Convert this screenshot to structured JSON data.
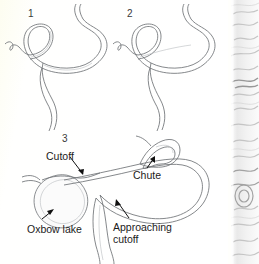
{
  "figure": {
    "kind": "river-meander-evolution-diagram",
    "background_color": "#fffffc",
    "ink_color": "#6f7276",
    "label_color": "#1b1b1b"
  },
  "panels": [
    {
      "id": "panel-1",
      "number": "1",
      "number_x": 28,
      "number_y": 8
    },
    {
      "id": "panel-2",
      "number": "2",
      "number_x": 127,
      "number_y": 8
    },
    {
      "id": "panel-3",
      "number": "3",
      "number_x": 62,
      "number_y": 133
    }
  ],
  "labels": [
    {
      "id": "label-cutoff",
      "text": "Cutoff",
      "x": 46,
      "y": 151
    },
    {
      "id": "label-chute",
      "text": "Chute",
      "x": 133,
      "y": 170
    },
    {
      "id": "label-oxbow-lake",
      "text": "Oxbow lake",
      "x": 27,
      "y": 224
    },
    {
      "id": "label-approaching-cutoff-1",
      "text": "Approaching",
      "x": 113,
      "y": 222
    },
    {
      "id": "label-approaching-cutoff-2",
      "text": "cutoff",
      "x": 113,
      "y": 234
    }
  ],
  "photo_strip": {
    "id": "aerial-photo-strip",
    "description": "grayscale aerial photograph sliver",
    "x": 231,
    "width": 28
  }
}
